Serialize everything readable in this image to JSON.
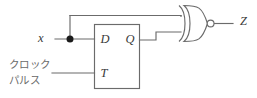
{
  "diagram": {
    "type": "logic-circuit-schematic",
    "colors": {
      "wire": "#6b6b6b",
      "label": "#3a3a3a",
      "japanese_label": "#6a6a6a",
      "junction": "#1b1b1b",
      "background": "#ffffff"
    }
  },
  "labels": {
    "input_x": "x",
    "output_z": "Z",
    "pin_d": "D",
    "pin_q": "Q",
    "pin_t": "T",
    "clock_line1": "クロック",
    "clock_line2": "パルス"
  },
  "components": [
    {
      "name": "flip-flop",
      "kind": "box",
      "pins": [
        "D",
        "Q",
        "T"
      ]
    },
    {
      "name": "xnor-gate",
      "kind": "xnor",
      "inputs": 2,
      "inverted_output": true
    },
    {
      "name": "junction-dot",
      "kind": "wire-junction"
    }
  ],
  "nets": [
    {
      "name": "x-to-d",
      "from": "x",
      "to": "D"
    },
    {
      "name": "x-to-xnor-top",
      "from": "x",
      "to": "xnor-input-1"
    },
    {
      "name": "q-to-xnor-bottom",
      "from": "Q",
      "to": "xnor-input-2"
    },
    {
      "name": "clock-to-t",
      "from": "clock-pulse",
      "to": "T"
    },
    {
      "name": "xnor-to-z",
      "from": "xnor-output",
      "to": "Z"
    }
  ]
}
